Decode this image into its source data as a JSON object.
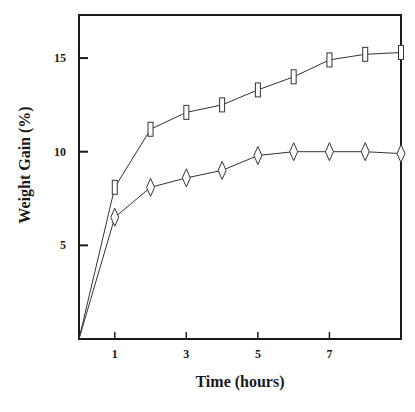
{
  "chart_data": {
    "type": "line",
    "title": "",
    "xlabel": "Time (hours)",
    "ylabel": "Weight Gain (%)",
    "xlim": [
      0,
      9
    ],
    "ylim": [
      0,
      17.3
    ],
    "grid": false,
    "legend": null,
    "x_ticks": [
      1,
      3,
      5,
      7
    ],
    "x_tick_labels": [
      "1",
      "3",
      "5",
      "7"
    ],
    "y_ticks": [
      5,
      10,
      15
    ],
    "y_tick_labels": [
      "5",
      "10",
      "15"
    ],
    "x": [
      0,
      1,
      2,
      3,
      4,
      5,
      6,
      7,
      8,
      9
    ],
    "series": [
      {
        "name": "square markers",
        "marker": "rectangle",
        "values": [
          0,
          8.1,
          11.2,
          12.1,
          12.5,
          13.3,
          14.0,
          14.9,
          15.2,
          15.3
        ]
      },
      {
        "name": "diamond markers",
        "marker": "diamond",
        "values": [
          0,
          6.5,
          8.1,
          8.6,
          9.0,
          9.8,
          10.0,
          10.0,
          10.0,
          9.9
        ]
      }
    ]
  },
  "colors": {
    "line": "#333333",
    "axis": "#1a1a1a",
    "background": "#ffffff"
  }
}
